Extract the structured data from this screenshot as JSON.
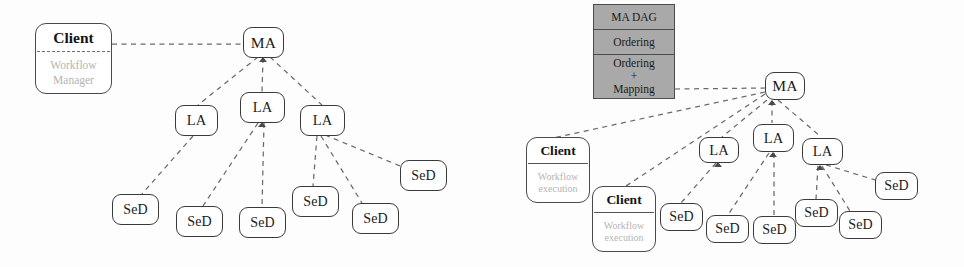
{
  "figure": {
    "background_color": "#fdfdfd",
    "node_border_color": "#3a3a3a",
    "edge_color": "#6b6b6b",
    "shaded_box_color": "#a9a9a9",
    "subtitle_text_color": "#b4b4b4"
  },
  "labels": {
    "ma": "MA",
    "la": "LA",
    "sed": "SeD",
    "client": "Client"
  },
  "left_panel": {
    "client": {
      "title": "Client",
      "sub_line1": "Workflow",
      "sub_line2": "Manager"
    },
    "ma": {
      "label": "MA"
    },
    "las": [
      {
        "label": "LA"
      },
      {
        "label": "LA"
      },
      {
        "label": "LA"
      }
    ],
    "seds": [
      {
        "label": "SeD"
      },
      {
        "label": "SeD"
      },
      {
        "label": "SeD"
      },
      {
        "label": "SeD"
      },
      {
        "label": "SeD"
      },
      {
        "label": "SeD"
      }
    ]
  },
  "right_panel": {
    "dag_box": {
      "rows": [
        {
          "line1": "MA DAG"
        },
        {
          "line1": "Ordering"
        },
        {
          "line1": "Ordering",
          "plus": "+",
          "line2": "Mapping"
        }
      ]
    },
    "clients": [
      {
        "title": "Client",
        "sub_line1": "Workflow",
        "sub_line2": "execution"
      },
      {
        "title": "Client",
        "sub_line1": "Workflow",
        "sub_line2": "execution"
      }
    ],
    "ma": {
      "label": "MA"
    },
    "las": [
      {
        "label": "LA"
      },
      {
        "label": "LA"
      },
      {
        "label": "LA"
      }
    ],
    "seds": [
      {
        "label": "SeD"
      },
      {
        "label": "SeD"
      },
      {
        "label": "SeD"
      },
      {
        "label": "SeD"
      },
      {
        "label": "SeD"
      },
      {
        "label": "SeD"
      }
    ]
  }
}
